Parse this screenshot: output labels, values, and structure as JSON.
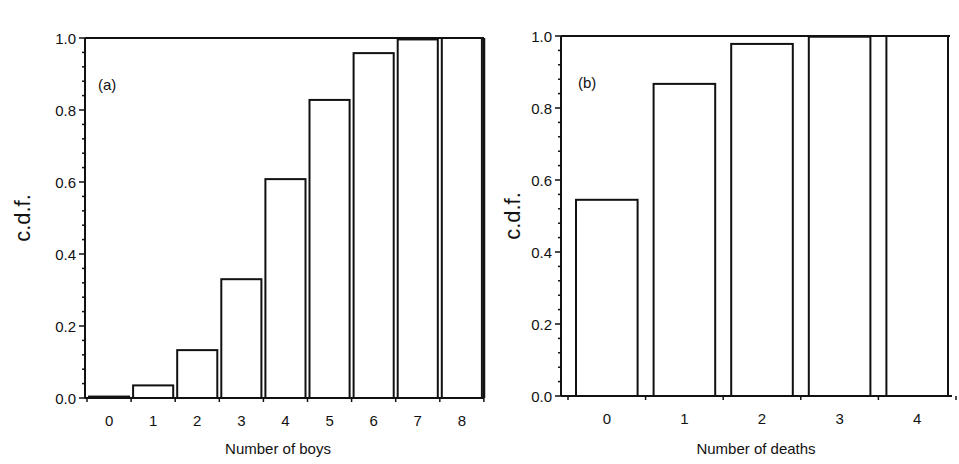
{
  "chart_data": [
    {
      "type": "bar",
      "panel_label": "(a)",
      "title": "",
      "xlabel": "Number of boys",
      "ylabel": "c.d.f.",
      "categories": [
        "0",
        "1",
        "2",
        "3",
        "4",
        "5",
        "6",
        "7",
        "8"
      ],
      "values": [
        0.004,
        0.035,
        0.133,
        0.33,
        0.608,
        0.828,
        0.958,
        0.996,
        1.0
      ],
      "ylim": [
        0.0,
        1.0
      ],
      "yticks": [
        "0.0",
        "0.2",
        "0.4",
        "0.6",
        "0.8",
        "1.0"
      ],
      "grid": false,
      "legend": null
    },
    {
      "type": "bar",
      "panel_label": "(b)",
      "title": "",
      "xlabel": "Number of deaths",
      "ylabel": "c.d.f.",
      "categories": [
        "0",
        "1",
        "2",
        "3",
        "4"
      ],
      "values": [
        0.545,
        0.867,
        0.978,
        0.998,
        1.0
      ],
      "ylim": [
        0.0,
        1.0
      ],
      "yticks": [
        "0.0",
        "0.2",
        "0.4",
        "0.6",
        "0.8",
        "1.0"
      ],
      "grid": false,
      "legend": null
    }
  ],
  "colors": {
    "ink": "#111111",
    "background": "#ffffff",
    "bar_fill": "#ffffff"
  }
}
